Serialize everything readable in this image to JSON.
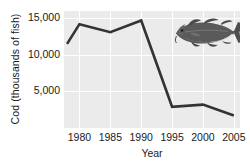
{
  "chart_data": {
    "type": "line",
    "title": "",
    "xlabel": "Year",
    "ylabel": "Cod (thousands of fish)",
    "xlim": [
      1977.5,
      2006
    ],
    "ylim": [
      0,
      16000
    ],
    "xticks": [
      1980,
      1985,
      1990,
      1995,
      2000,
      2005
    ],
    "xticklabels": [
      "1980",
      "1985",
      "1990",
      "1995",
      "2000",
      "2005"
    ],
    "yticks": [
      5000,
      10000,
      15000
    ],
    "yticklabels": [
      "5,000",
      "10,000",
      "15,000"
    ],
    "grid": true,
    "grid_color": "#ffffff",
    "panel_background": "#ebebeb",
    "legend": "none",
    "series": [
      {
        "name": "Cod",
        "color": "#333333",
        "x": [
          1978,
          1980,
          1985,
          1990,
          1995,
          2000,
          2005
        ],
        "values": [
          11500,
          14200,
          13100,
          14700,
          2900,
          3200,
          1700
        ]
      }
    ],
    "annotations": [
      {
        "type": "image",
        "name": "cod-fish-illustration",
        "description": "Cod fish silhouette",
        "color": "#555555"
      }
    ]
  },
  "icons": {
    "fish": "fish-icon"
  }
}
